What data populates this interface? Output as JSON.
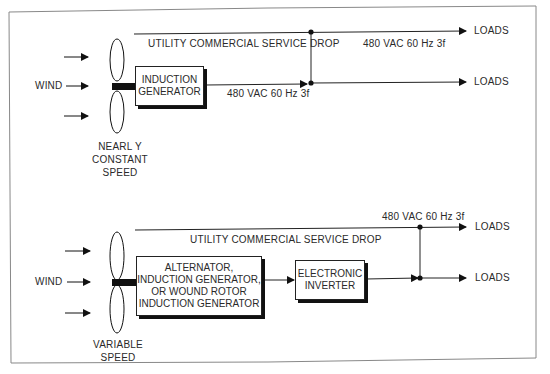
{
  "panels": [
    {
      "id": "constant-speed",
      "wind_label": "WIND",
      "rotor_caption": [
        "NEARL Y",
        "CONSTANT",
        "SPEED"
      ],
      "utility_line_label": "UTILITY  COMMERCIAL  SERVICE  DROP",
      "generator_box": [
        "INDUCTION",
        "GENERATOR"
      ],
      "generator_output_label": "480 VAC  60 Hz  3f",
      "utility_output_label": "480 VAC  60 Hz  3f",
      "loads": [
        "LOADS",
        "LOADS"
      ]
    },
    {
      "id": "variable-speed",
      "wind_label": "WIND",
      "rotor_caption": [
        "VARIABLE",
        "SPEED"
      ],
      "utility_line_label": "UTILITY  COMMERCIAL  SERVICE  DROP",
      "generator_box": [
        "ALTERNATOR,",
        "INDUCTION GENERATOR,",
        "OR WOUND ROTOR",
        "INDUCTION GENERATOR"
      ],
      "inverter_box": [
        "ELECTRONIC",
        "INVERTER"
      ],
      "utility_output_label": "480 VAC  60 Hz  3f",
      "loads": [
        "LOADS",
        "LOADS"
      ]
    }
  ],
  "colors": {
    "line": "#222222",
    "border": "#888888",
    "text": "#2a2a2a"
  }
}
